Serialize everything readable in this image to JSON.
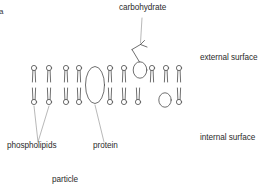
{
  "figure": {
    "panel_mark": "a",
    "caption_fragment": "particle",
    "stroke_color": "#4a4a4a",
    "text_color": "#2b2b2b",
    "background": "#ffffff"
  },
  "labels": {
    "carbohydrate": "carbohydrate",
    "external_surface": "external surface",
    "internal_surface": "internal surface",
    "phospholipids": "phospholipids",
    "protein": "protein"
  },
  "diagram_data": {
    "type": "cell-membrane-cross-section",
    "structure": "phospholipid bilayer",
    "upper_leaflet_heads_x": [
      34,
      49,
      66,
      79,
      110,
      124,
      152,
      166,
      179
    ],
    "lower_leaflet_heads_x": [
      34,
      49,
      66,
      79,
      110,
      124,
      138,
      179
    ],
    "upper_head_y": 68,
    "lower_head_y": 102,
    "head_radius": 2.6,
    "proteins": [
      {
        "name": "transmembrane-protein",
        "cx": 95,
        "cy": 85,
        "rx": 9,
        "ry": 18
      },
      {
        "name": "glycoprotein",
        "cx": 140,
        "cy": 70,
        "rx": 6.5,
        "ry": 8
      },
      {
        "name": "inner-protein",
        "cx": 165,
        "cy": 100,
        "rx": 6,
        "ry": 7
      }
    ],
    "carbohydrate": {
      "attached_to": "glycoprotein",
      "shape": "branched",
      "anchor_x": 140,
      "anchor_y": 63
    }
  }
}
